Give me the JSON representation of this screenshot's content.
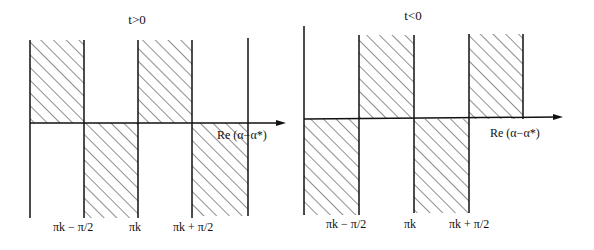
{
  "panels": [
    {
      "title": "t>0",
      "axis_label": "Re (α−α*)",
      "tick_labels": [
        "πk − π/2",
        "πk",
        "πk + π/2"
      ]
    },
    {
      "title": "t<0",
      "axis_label": "Re (α−α*)",
      "tick_labels": [
        "πk − π/2",
        "πk",
        "πk + π/2"
      ]
    }
  ],
  "colors": {
    "ink": "#111111",
    "background": "#ffffff"
  }
}
